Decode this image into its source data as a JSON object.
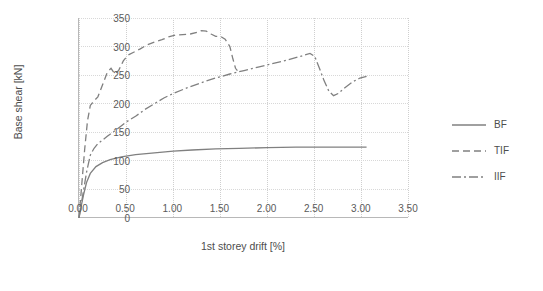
{
  "chart_data": {
    "type": "line",
    "title": "",
    "xlabel": "1st storey drift [%]",
    "ylabel": "Base shear [kN]",
    "xlim": [
      0.0,
      3.5
    ],
    "ylim": [
      0,
      350
    ],
    "xticks": [
      "0.00",
      "0.50",
      "1.00",
      "1.50",
      "2.00",
      "2.50",
      "3.00",
      "3.50"
    ],
    "xtick_values": [
      0.0,
      0.5,
      1.0,
      1.5,
      2.0,
      2.5,
      3.0,
      3.5
    ],
    "yticks": [
      "0",
      "50",
      "100",
      "150",
      "200",
      "250",
      "300",
      "350"
    ],
    "ytick_values": [
      0,
      50,
      100,
      150,
      200,
      250,
      300,
      350
    ],
    "grid": true,
    "legend_position": "right",
    "series": [
      {
        "name": "BF",
        "style": "solid",
        "color": "#808080",
        "points": [
          [
            0.0,
            0.0
          ],
          [
            0.02,
            18
          ],
          [
            0.05,
            42
          ],
          [
            0.08,
            62
          ],
          [
            0.12,
            78
          ],
          [
            0.18,
            90
          ],
          [
            0.25,
            97
          ],
          [
            0.33,
            102
          ],
          [
            0.45,
            107
          ],
          [
            0.6,
            111
          ],
          [
            0.8,
            114
          ],
          [
            1.0,
            117
          ],
          [
            1.2,
            119
          ],
          [
            1.45,
            121
          ],
          [
            1.7,
            122
          ],
          [
            2.0,
            123
          ],
          [
            2.3,
            124
          ],
          [
            2.6,
            124
          ],
          [
            2.85,
            124
          ],
          [
            3.05,
            124
          ]
        ]
      },
      {
        "name": "TIF",
        "style": "dashed",
        "color": "#808080",
        "points": [
          [
            0.0,
            0.0
          ],
          [
            0.03,
            60
          ],
          [
            0.06,
            120
          ],
          [
            0.09,
            170
          ],
          [
            0.12,
            197
          ],
          [
            0.16,
            205
          ],
          [
            0.2,
            212
          ],
          [
            0.25,
            233
          ],
          [
            0.3,
            255
          ],
          [
            0.34,
            262
          ],
          [
            0.38,
            252
          ],
          [
            0.42,
            258
          ],
          [
            0.47,
            275
          ],
          [
            0.52,
            285
          ],
          [
            0.58,
            290
          ],
          [
            0.65,
            296
          ],
          [
            0.72,
            303
          ],
          [
            0.8,
            308
          ],
          [
            0.88,
            312
          ],
          [
            0.95,
            317
          ],
          [
            1.02,
            320
          ],
          [
            1.1,
            321
          ],
          [
            1.18,
            322
          ],
          [
            1.25,
            325
          ],
          [
            1.3,
            328
          ],
          [
            1.35,
            327
          ],
          [
            1.4,
            322
          ],
          [
            1.45,
            318
          ],
          [
            1.5,
            318
          ],
          [
            1.55,
            313
          ],
          [
            1.6,
            300
          ],
          [
            1.63,
            280
          ],
          [
            1.66,
            262
          ],
          [
            1.68,
            258
          ]
        ]
      },
      {
        "name": "IIF",
        "style": "dash-dot",
        "color": "#808080",
        "points": [
          [
            0.0,
            0.0
          ],
          [
            0.04,
            40
          ],
          [
            0.08,
            80
          ],
          [
            0.12,
            110
          ],
          [
            0.16,
            122
          ],
          [
            0.2,
            130
          ],
          [
            0.3,
            143
          ],
          [
            0.4,
            155
          ],
          [
            0.5,
            168
          ],
          [
            0.6,
            178
          ],
          [
            0.7,
            190
          ],
          [
            0.8,
            200
          ],
          [
            0.9,
            210
          ],
          [
            1.0,
            218
          ],
          [
            1.15,
            228
          ],
          [
            1.3,
            237
          ],
          [
            1.45,
            245
          ],
          [
            1.6,
            252
          ],
          [
            1.75,
            258
          ],
          [
            1.9,
            264
          ],
          [
            2.05,
            270
          ],
          [
            2.2,
            276
          ],
          [
            2.35,
            283
          ],
          [
            2.45,
            288
          ],
          [
            2.5,
            283
          ],
          [
            2.55,
            262
          ],
          [
            2.6,
            240
          ],
          [
            2.65,
            222
          ],
          [
            2.7,
            214
          ],
          [
            2.75,
            218
          ],
          [
            2.82,
            228
          ],
          [
            2.9,
            238
          ],
          [
            2.98,
            245
          ],
          [
            3.05,
            248
          ]
        ]
      }
    ],
    "legend_entries": [
      {
        "label": "BF",
        "style": "solid"
      },
      {
        "label": "TIF",
        "style": "dashed"
      },
      {
        "label": "IIF",
        "style": "dash-dot"
      }
    ]
  },
  "watermarks": {
    "one": "",
    "two": ""
  }
}
